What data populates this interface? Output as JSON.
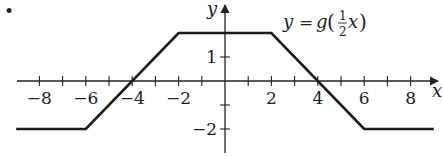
{
  "bullet": "•",
  "chart_data": {
    "type": "line",
    "title": "",
    "function_label": "y = g(1/2 x)",
    "function_label_parts": {
      "lhs": "y",
      "eq": "=",
      "fn": "g",
      "num": "1",
      "den": "2",
      "var": "x"
    },
    "xlabel": "x",
    "ylabel": "y",
    "x_ticks": [
      -8,
      -6,
      -4,
      -2,
      2,
      4,
      6,
      8
    ],
    "x_tick_labels": [
      "−8",
      "−6",
      "−4",
      "−2",
      "2",
      "4",
      "6",
      "8"
    ],
    "y_ticks": [
      1,
      -2
    ],
    "y_tick_labels": [
      "1",
      "−2"
    ],
    "xlim": [
      -9,
      9
    ],
    "ylim": [
      -2.5,
      2.5
    ],
    "grid": false,
    "series": [
      {
        "name": "y = g(1/2 x)",
        "x": [
          -9,
          -6,
          -2,
          2,
          6,
          9
        ],
        "y": [
          -2,
          -2,
          2,
          2,
          -2,
          -2
        ]
      }
    ],
    "color": "#1a1a1a"
  }
}
